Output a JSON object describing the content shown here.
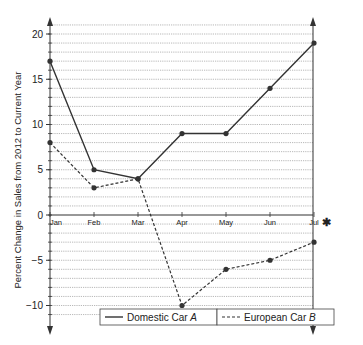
{
  "chart_data": {
    "type": "line",
    "title": "",
    "xlabel": "",
    "ylabel": "Percent Change in Sales from 2012 to Current Year",
    "categories": [
      "Jan",
      "Feb",
      "Mar",
      "Apr",
      "May",
      "Jun",
      "Jul"
    ],
    "series": [
      {
        "name": "Domestic Car A",
        "style": "solid",
        "values": [
          17,
          5,
          4,
          9,
          9,
          14,
          19
        ]
      },
      {
        "name": "European Car B",
        "style": "dashed",
        "values": [
          8,
          3,
          4,
          -10,
          -6,
          -5,
          -3
        ]
      }
    ],
    "ylim": [
      -12,
      21
    ],
    "yticks": [
      20,
      15,
      10,
      5,
      0,
      -5,
      -10
    ],
    "grid": true,
    "legend_position": "bottom",
    "annotation": "✱"
  },
  "legend": {
    "a_prefix": "Domestic Car ",
    "a_suffix": "A",
    "b_prefix": "European Car ",
    "b_suffix": "B"
  }
}
